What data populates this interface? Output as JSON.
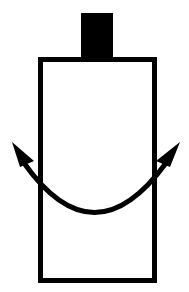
{
  "diagram": {
    "colors": {
      "stroke": "#000000",
      "fill": "#ffffff",
      "cap": "#000000"
    },
    "elements": [
      {
        "name": "top-cap",
        "kind": "filled-rectangle"
      },
      {
        "name": "body",
        "kind": "outlined-rectangle"
      },
      {
        "name": "rotation-arrow",
        "kind": "double-headed-curved-arrow"
      }
    ]
  }
}
